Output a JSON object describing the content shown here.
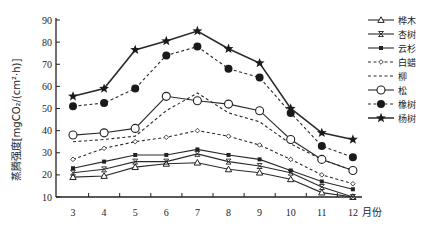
{
  "chart_data": {
    "type": "line",
    "title": "",
    "xlabel": "月份",
    "ylabel": "蒸腾强度[mgCO₂/(cm²·h)]",
    "x": [
      3,
      4,
      5,
      6,
      7,
      8,
      9,
      10,
      11,
      12
    ],
    "ylim": [
      10,
      90
    ],
    "yticks": [
      10,
      20,
      30,
      40,
      50,
      60,
      70,
      80,
      90
    ],
    "grid": false,
    "legend_position": "right",
    "series": [
      {
        "name": "桦木",
        "style": "solid",
        "marker": "open-triangle",
        "values": [
          19,
          19.5,
          23.5,
          25,
          25.5,
          22.5,
          21,
          18,
          12,
          10
        ]
      },
      {
        "name": "杏树",
        "style": "solid",
        "marker": "x-cross",
        "values": [
          21,
          22.5,
          26,
          26,
          29.5,
          26,
          24,
          21,
          14.5,
          10
        ]
      },
      {
        "name": "云杉",
        "style": "solid",
        "marker": "filled-square",
        "values": [
          23,
          26,
          29,
          29,
          31.5,
          29,
          27,
          22,
          17,
          13.5
        ]
      },
      {
        "name": "白蜡",
        "style": "dashed",
        "marker": "small-diamond",
        "values": [
          27,
          32,
          35,
          37,
          40,
          37.5,
          33.5,
          27,
          20,
          16
        ]
      },
      {
        "name": "柳",
        "style": "dashed",
        "marker": "none",
        "values": [
          35,
          36,
          37.5,
          49,
          57,
          48,
          44,
          34,
          27,
          22
        ]
      },
      {
        "name": "松",
        "style": "solid",
        "marker": "open-circle",
        "values": [
          38,
          39,
          41,
          55.5,
          53.5,
          52,
          49,
          36,
          27,
          22
        ]
      },
      {
        "name": "橡树",
        "style": "dashed",
        "marker": "filled-circle",
        "values": [
          51,
          52.5,
          59,
          74,
          78,
          68,
          64,
          48,
          33,
          28
        ]
      },
      {
        "name": "杨树",
        "style": "solid",
        "marker": "filled-star",
        "values": [
          55.5,
          59,
          76.5,
          80.5,
          85,
          77,
          70.5,
          50,
          39,
          36
        ]
      }
    ]
  },
  "axes": {
    "y_title": "蒸腾强度[mgCO₂/(cm²·h)]",
    "x_unit": "月份"
  }
}
